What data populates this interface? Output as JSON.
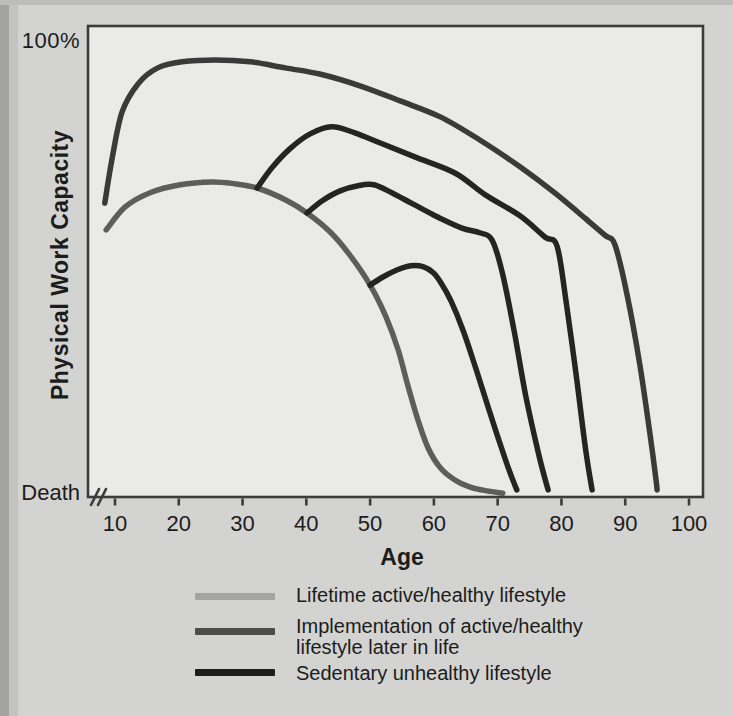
{
  "figure": {
    "y_top_label": "100%",
    "y_bottom_label": "Death",
    "ylabel": "Physical Work Capacity",
    "xlabel": "Age"
  },
  "legend": {
    "position": "bottom",
    "items": [
      {
        "color": "#a4a4a4",
        "label_lines": [
          "Lifetime active/healthy lifestyle",
          ""
        ]
      },
      {
        "color": "#4c4c4c",
        "label_lines": [
          "Implementation of active/healthy",
          "lifestyle later in life"
        ]
      },
      {
        "color": "#1d1d1d",
        "label_lines": [
          "Sedentary unhealthy lifestyle",
          ""
        ]
      }
    ]
  },
  "chart_data": {
    "type": "line",
    "title": "",
    "xlabel": "Age",
    "ylabel": "Physical Work Capacity",
    "x_ticks": [
      10,
      20,
      30,
      40,
      50,
      60,
      70,
      80,
      90,
      100
    ],
    "x_range": [
      5,
      102
    ],
    "y_range_pct": [
      0,
      100
    ],
    "y_axis_labels": [
      "Death",
      "100%"
    ],
    "x_axis_break_near_origin": true,
    "grid": false,
    "legend_position": "bottom",
    "series": [
      {
        "name": "Sedentary unhealthy lifestyle",
        "role": "sedentary",
        "color": "#5d5d5d",
        "points": [
          [
            8.6,
            56.7
          ],
          [
            11.6,
            61.6
          ],
          [
            15.5,
            64.6
          ],
          [
            20.2,
            66.3
          ],
          [
            25.2,
            66.9
          ],
          [
            28.8,
            66.5
          ],
          [
            32.3,
            65.6
          ],
          [
            36.7,
            63.1
          ],
          [
            40.1,
            60.3
          ],
          [
            43.7,
            56.3
          ],
          [
            46.8,
            51.4
          ],
          [
            50,
            45
          ],
          [
            52.5,
            38.2
          ],
          [
            54.4,
            31.2
          ],
          [
            55.9,
            23.8
          ],
          [
            57.5,
            16.4
          ],
          [
            59.1,
            10.4
          ],
          [
            61,
            6.2
          ],
          [
            63.3,
            3.6
          ],
          [
            65.7,
            2.1
          ],
          [
            68.3,
            1.3
          ],
          [
            70.8,
            0.8
          ]
        ]
      },
      {
        "name": "Implementation of active/healthy lifestyle later in life",
        "role": "implementation-at-32",
        "color": "#242424",
        "points": [
          [
            32.3,
            65.6
          ],
          [
            34.6,
            69.9
          ],
          [
            37.4,
            73.9
          ],
          [
            40.6,
            77.1
          ],
          [
            44,
            78.6
          ],
          [
            47.6,
            77.3
          ],
          [
            51.5,
            75.2
          ],
          [
            57,
            72.2
          ],
          [
            63.3,
            68.8
          ],
          [
            68,
            64.2
          ],
          [
            73.5,
            59.7
          ],
          [
            77.4,
            55.2
          ],
          [
            79.3,
            53.3
          ],
          [
            80.7,
            41.8
          ],
          [
            82.4,
            24.9
          ],
          [
            83.8,
            10
          ],
          [
            84.8,
            1.5
          ]
        ]
      },
      {
        "name": "Implementation of active/healthy lifestyle later in life",
        "role": "implementation-at-40",
        "color": "#242424",
        "points": [
          [
            40.1,
            60.3
          ],
          [
            42.5,
            62.9
          ],
          [
            45.3,
            65
          ],
          [
            48.1,
            66.1
          ],
          [
            50.6,
            66.3
          ],
          [
            53.4,
            64.6
          ],
          [
            56.6,
            62.3
          ],
          [
            60.5,
            59.5
          ],
          [
            64.4,
            57.1
          ],
          [
            67.2,
            56.1
          ],
          [
            69.1,
            54.6
          ],
          [
            70.7,
            47.8
          ],
          [
            72.6,
            35.1
          ],
          [
            74.4,
            21.5
          ],
          [
            76.5,
            8.7
          ],
          [
            77.9,
            1.5
          ]
        ]
      },
      {
        "name": "Implementation of active/healthy lifestyle later in life",
        "role": "implementation-at-50",
        "color": "#242424",
        "points": [
          [
            50,
            45
          ],
          [
            52,
            46.7
          ],
          [
            54.2,
            48.2
          ],
          [
            56.4,
            49.1
          ],
          [
            58.3,
            48.9
          ],
          [
            59.9,
            47.6
          ],
          [
            61.1,
            45.5
          ],
          [
            62.7,
            41.6
          ],
          [
            64.6,
            35.3
          ],
          [
            66.6,
            27.2
          ],
          [
            68.6,
            18.7
          ],
          [
            70.5,
            10.8
          ],
          [
            71.9,
            5.3
          ],
          [
            73,
            1.5
          ]
        ]
      },
      {
        "name": "Lifetime active/healthy lifestyle",
        "role": "lifetime-active",
        "color": "#3a3a3a",
        "points": [
          [
            8.4,
            62.4
          ],
          [
            9.5,
            71.5
          ],
          [
            11.1,
            81.7
          ],
          [
            13.6,
            87.7
          ],
          [
            16.7,
            91.1
          ],
          [
            20.5,
            92.4
          ],
          [
            25.7,
            92.8
          ],
          [
            31.2,
            92.4
          ],
          [
            36.7,
            91.1
          ],
          [
            42.1,
            89.8
          ],
          [
            48.4,
            87.3
          ],
          [
            54.7,
            84.1
          ],
          [
            61,
            80.7
          ],
          [
            67.2,
            75.8
          ],
          [
            73.5,
            70.1
          ],
          [
            79,
            64.5
          ],
          [
            83.7,
            59.2
          ],
          [
            86.8,
            55.6
          ],
          [
            88.4,
            53.5
          ],
          [
            90.3,
            42.9
          ],
          [
            92.3,
            28
          ],
          [
            93.9,
            13.2
          ],
          [
            94.8,
            4
          ],
          [
            95,
            1.5
          ]
        ]
      }
    ],
    "calibration": {
      "plot_box_px": [
        88,
        26,
        703,
        497
      ],
      "age_to_px": {
        "age0": 10,
        "x0": 115,
        "px_per_year": 6.3778
      },
      "pct_to_px": {
        "pct0": 0,
        "y0": 497,
        "px_per_pct": 4.71
      },
      "axis_color": "#3c3c3c",
      "plot_bg": "#eaeae8",
      "stroke_width": 5.5
    }
  }
}
